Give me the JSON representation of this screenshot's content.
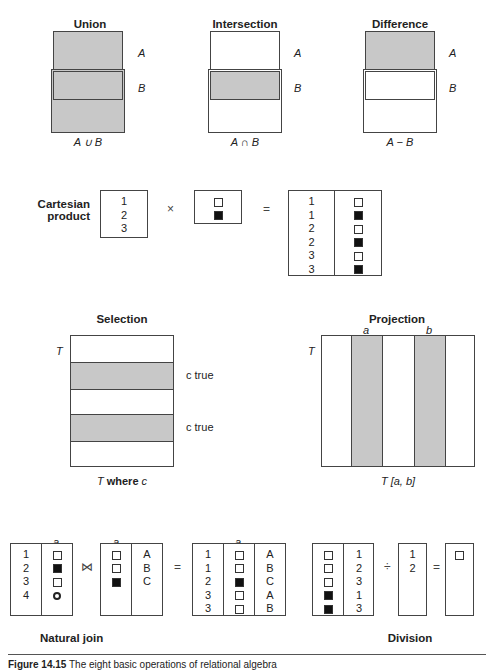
{
  "set_ops": {
    "union": {
      "title": "Union",
      "label_a": "A",
      "label_b": "B",
      "caption": "A ∪ B"
    },
    "intersection": {
      "title": "Intersection",
      "label_a": "A",
      "label_b": "B",
      "caption": "A ∩ B"
    },
    "difference": {
      "title": "Difference",
      "label_a": "A",
      "label_b": "B",
      "caption": "A − B"
    }
  },
  "cartesian": {
    "title_line1": "Cartesian",
    "title_line2": "product",
    "left_values": [
      "1",
      "2",
      "3"
    ],
    "right_values": [
      "empty",
      "filled"
    ],
    "times_symbol": "×",
    "equals_symbol": "=",
    "result_rows": [
      {
        "num": "1",
        "sym": "empty"
      },
      {
        "num": "1",
        "sym": "filled"
      },
      {
        "num": "2",
        "sym": "empty"
      },
      {
        "num": "2",
        "sym": "filled"
      },
      {
        "num": "3",
        "sym": "empty"
      },
      {
        "num": "3",
        "sym": "filled"
      }
    ]
  },
  "selection": {
    "title": "Selection",
    "table_label": "T",
    "cond_label_1": "c true",
    "cond_label_2": "c true",
    "caption_t": "T",
    "caption_where": "where",
    "caption_c": "c"
  },
  "projection": {
    "title": "Projection",
    "table_label": "T",
    "col_a": "a",
    "col_b": "b",
    "caption": "T [a, b]"
  },
  "natural_join": {
    "title": "Natural join",
    "join_symbol": "⋈",
    "equals_symbol": "=",
    "col_label": "a",
    "left_rows": [
      {
        "num": "1",
        "sym": "empty"
      },
      {
        "num": "2",
        "sym": "filled"
      },
      {
        "num": "3",
        "sym": "empty"
      },
      {
        "num": "4",
        "sym": "circle"
      }
    ],
    "right_rows": [
      {
        "sym": "empty",
        "letter": "A"
      },
      {
        "sym": "empty",
        "letter": "B"
      },
      {
        "sym": "filled",
        "letter": "C"
      }
    ],
    "result_rows": [
      {
        "num": "1",
        "sym": "empty",
        "letter": "A"
      },
      {
        "num": "1",
        "sym": "empty",
        "letter": "B"
      },
      {
        "num": "2",
        "sym": "filled",
        "letter": "C"
      },
      {
        "num": "3",
        "sym": "empty",
        "letter": "A"
      },
      {
        "num": "3",
        "sym": "empty",
        "letter": "B"
      }
    ]
  },
  "division": {
    "title": "Division",
    "div_symbol": "÷",
    "equals_symbol": "=",
    "dividend_rows": [
      {
        "sym": "empty",
        "num": "1"
      },
      {
        "sym": "empty",
        "num": "2"
      },
      {
        "sym": "empty",
        "num": "3"
      },
      {
        "sym": "filled",
        "num": "1"
      },
      {
        "sym": "filled",
        "num": "3"
      }
    ],
    "divisor_values": [
      "1",
      "2"
    ],
    "result_syms": [
      "empty"
    ]
  },
  "caption": {
    "figure_label": "Figure 14.15",
    "text": "The eight basic operations of relational algebra"
  }
}
